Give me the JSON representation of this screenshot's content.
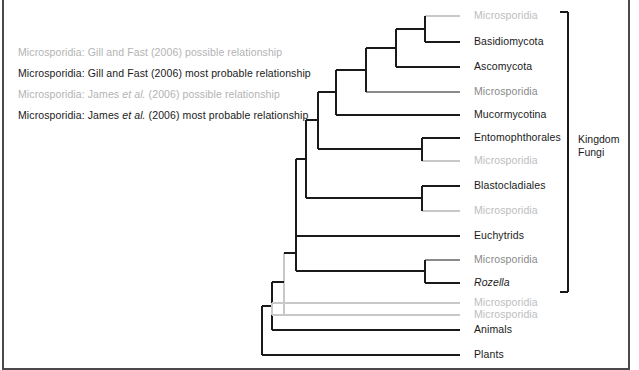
{
  "figure": {
    "width": 639,
    "height": 370,
    "background": "#ffffff",
    "frame_color": "#4a4a4a"
  },
  "colors": {
    "dark_branch": "#1a1a1a",
    "gray_branch": "#8a8a8a",
    "light_branch": "#c8c8c8",
    "dark_text": "#1a1a1a",
    "gray_text": "#8a8a8a",
    "light_text": "#bdbdbd"
  },
  "legend": {
    "items": [
      {
        "prefix": "Microsporidia: Gill and Fast (2006) possible relationship",
        "style": "gray",
        "italic_part": "",
        "suffix": ""
      },
      {
        "prefix": "Microsporidia: Gill and Fast (2006) most probable relationship",
        "style": "dark",
        "italic_part": "",
        "suffix": ""
      },
      {
        "prefix": "Microsporidia: James ",
        "style": "gray",
        "italic_part": "et al.",
        "suffix": " (2006) possible relationship"
      },
      {
        "prefix": "Microsporidia: James ",
        "style": "dark",
        "italic_part": "et al.",
        "suffix": " (2006) most probable relationship"
      }
    ]
  },
  "annotation": {
    "kingdom_bracket_label": "Kingdom\nFungi"
  },
  "chart_data": {
    "type": "tree",
    "title": "",
    "tips": [
      {
        "id": "t1",
        "label": "Microsporidia",
        "y": 16,
        "style": "light",
        "branch_x": 460,
        "parent_x": 425
      },
      {
        "id": "t2",
        "label": "Basidiomycota",
        "y": 42,
        "style": "dark",
        "branch_x": 460,
        "parent_x": 425
      },
      {
        "id": "t3",
        "label": "Ascomycota",
        "y": 67,
        "style": "dark",
        "branch_x": 460,
        "parent_x": 396
      },
      {
        "id": "t4",
        "label": "Microsporidia",
        "y": 92,
        "style": "gray",
        "branch_x": 460,
        "parent_x": 366
      },
      {
        "id": "t5",
        "label": "Mucormycotina",
        "y": 115,
        "style": "dark",
        "branch_x": 460,
        "parent_x": 336
      },
      {
        "id": "t6",
        "label": "Entomophthorales",
        "y": 138,
        "style": "dark",
        "branch_x": 460,
        "parent_x": 422
      },
      {
        "id": "t7",
        "label": "Microsporidia",
        "y": 161,
        "style": "light",
        "branch_x": 460,
        "parent_x": 422
      },
      {
        "id": "t8",
        "label": "Blastocladiales",
        "y": 186,
        "style": "dark",
        "branch_x": 460,
        "parent_x": 422
      },
      {
        "id": "t9",
        "label": "Microsporidia",
        "y": 211,
        "style": "light",
        "branch_x": 460,
        "parent_x": 422
      },
      {
        "id": "t10",
        "label": "Euchytrids",
        "y": 236,
        "style": "dark",
        "branch_x": 460,
        "parent_x": 296
      },
      {
        "id": "t11",
        "label": "Microsporidia",
        "y": 260,
        "style": "gray",
        "branch_x": 460,
        "parent_x": 425
      },
      {
        "id": "t12",
        "label": "Rozella",
        "y": 283,
        "style": "dark",
        "branch_x": 460,
        "parent_x": 425,
        "italic": true
      },
      {
        "id": "t13",
        "label": "Microsporidia",
        "y": 303,
        "style": "light",
        "branch_x": 460,
        "parent_x": 284
      },
      {
        "id": "t14",
        "label": "Microsporidia",
        "y": 315,
        "style": "light",
        "branch_x": 460,
        "parent_x": 284
      },
      {
        "id": "t15",
        "label": "Animals",
        "y": 330,
        "style": "dark",
        "branch_x": 460,
        "parent_x": 272
      },
      {
        "id": "t16",
        "label": "Plants",
        "y": 355,
        "style": "dark",
        "branch_x": 460,
        "parent_x": 262
      }
    ],
    "kingdom_bracket": {
      "x": 568,
      "y_top": 12,
      "y_bottom": 292,
      "tick": 8
    }
  }
}
